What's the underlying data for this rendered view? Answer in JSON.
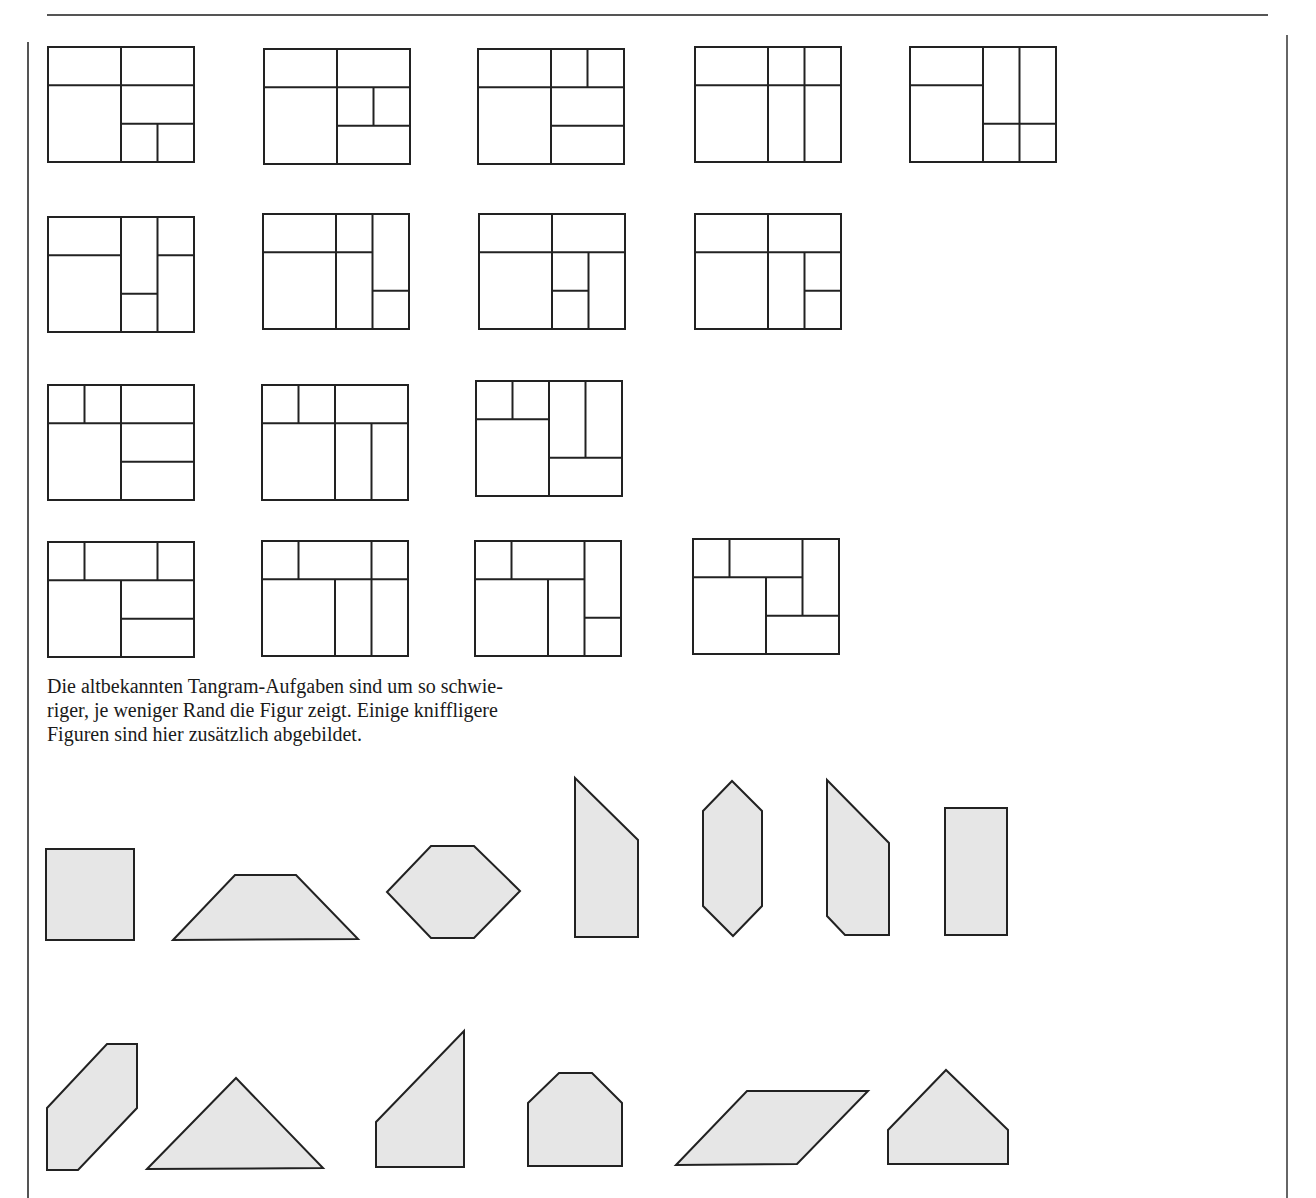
{
  "page": {
    "caption_lines": [
      "Die altbekannten Tangram-Aufgaben sind um so schwie-",
      "riger, je weniger Rand die Figur zeigt. Einige kniffligere",
      "Figuren sind hier zusätzlich abgebildet."
    ]
  },
  "colors": {
    "ink": "#222222",
    "shape_fill": "#e6e6e6",
    "rule": "#555555"
  },
  "rect_puzzles": {
    "box_width": 146,
    "box_height": 115,
    "grid": {
      "cols": 4,
      "rows": 3
    },
    "items": [
      {
        "x": 48,
        "y": 47,
        "lines": [
          [
            "h",
            1,
            0,
            4
          ],
          [
            "v",
            2,
            0,
            3
          ],
          [
            "h",
            2,
            2,
            4
          ],
          [
            "v",
            3,
            2,
            3
          ]
        ]
      },
      {
        "x": 264,
        "y": 49,
        "lines": [
          [
            "h",
            1,
            0,
            4
          ],
          [
            "v",
            2,
            0,
            3
          ],
          [
            "h",
            2,
            2,
            4
          ],
          [
            "v",
            3,
            1,
            2
          ]
        ]
      },
      {
        "x": 478,
        "y": 49,
        "lines": [
          [
            "h",
            1,
            0,
            4
          ],
          [
            "v",
            2,
            0,
            3
          ],
          [
            "v",
            3,
            0,
            1
          ],
          [
            "h",
            2,
            2,
            4
          ]
        ]
      },
      {
        "x": 695,
        "y": 47,
        "lines": [
          [
            "h",
            1,
            0,
            4
          ],
          [
            "v",
            2,
            0,
            3
          ],
          [
            "v",
            3,
            0,
            3
          ]
        ]
      },
      {
        "x": 910,
        "y": 47,
        "lines": [
          [
            "h",
            1,
            0,
            2
          ],
          [
            "v",
            2,
            0,
            3
          ],
          [
            "v",
            3,
            0,
            3
          ],
          [
            "h",
            2,
            2,
            4
          ]
        ]
      },
      {
        "x": 48,
        "y": 217,
        "lines": [
          [
            "h",
            1,
            0,
            2
          ],
          [
            "v",
            2,
            0,
            3
          ],
          [
            "v",
            3,
            0,
            3
          ],
          [
            "h",
            2,
            2,
            3
          ],
          [
            "h",
            1,
            3,
            4
          ]
        ]
      },
      {
        "x": 263,
        "y": 214,
        "lines": [
          [
            "h",
            1,
            0,
            3
          ],
          [
            "v",
            2,
            0,
            3
          ],
          [
            "v",
            3,
            0,
            3
          ],
          [
            "h",
            2,
            3,
            4
          ]
        ]
      },
      {
        "x": 479,
        "y": 214,
        "lines": [
          [
            "h",
            1,
            0,
            4
          ],
          [
            "v",
            2,
            0,
            3
          ],
          [
            "v",
            3,
            1,
            3
          ],
          [
            "h",
            2,
            2,
            3
          ]
        ]
      },
      {
        "x": 695,
        "y": 214,
        "lines": [
          [
            "h",
            1,
            0,
            4
          ],
          [
            "v",
            2,
            0,
            3
          ],
          [
            "v",
            3,
            1,
            3
          ],
          [
            "h",
            2,
            3,
            4
          ]
        ]
      },
      {
        "x": 48,
        "y": 385,
        "lines": [
          [
            "h",
            1,
            0,
            4
          ],
          [
            "v",
            1,
            0,
            1
          ],
          [
            "v",
            2,
            0,
            3
          ],
          [
            "h",
            2,
            2,
            4
          ]
        ]
      },
      {
        "x": 262,
        "y": 385,
        "lines": [
          [
            "h",
            1,
            0,
            4
          ],
          [
            "v",
            1,
            0,
            1
          ],
          [
            "v",
            2,
            0,
            3
          ],
          [
            "v",
            3,
            1,
            3
          ]
        ]
      },
      {
        "x": 476,
        "y": 381,
        "lines": [
          [
            "v",
            1,
            0,
            1
          ],
          [
            "v",
            2,
            0,
            3
          ],
          [
            "h",
            1,
            0,
            2
          ],
          [
            "v",
            3,
            0,
            2
          ],
          [
            "h",
            2,
            2,
            4
          ]
        ]
      },
      {
        "x": 48,
        "y": 542,
        "lines": [
          [
            "h",
            1,
            0,
            4
          ],
          [
            "v",
            1,
            0,
            1
          ],
          [
            "v",
            3,
            0,
            1
          ],
          [
            "v",
            2,
            1,
            3
          ],
          [
            "h",
            2,
            2,
            4
          ]
        ]
      },
      {
        "x": 262,
        "y": 541,
        "lines": [
          [
            "h",
            1,
            0,
            4
          ],
          [
            "v",
            1,
            0,
            1
          ],
          [
            "v",
            3,
            0,
            3
          ],
          [
            "v",
            2,
            1,
            3
          ]
        ]
      },
      {
        "x": 475,
        "y": 541,
        "lines": [
          [
            "h",
            1,
            0,
            3
          ],
          [
            "v",
            1,
            0,
            1
          ],
          [
            "v",
            3,
            0,
            3
          ],
          [
            "v",
            2,
            1,
            3
          ],
          [
            "h",
            2,
            3,
            4
          ]
        ]
      },
      {
        "x": 693,
        "y": 539,
        "lines": [
          [
            "h",
            1,
            0,
            3
          ],
          [
            "v",
            1,
            0,
            1
          ],
          [
            "v",
            3,
            0,
            2
          ],
          [
            "v",
            2,
            1,
            3
          ],
          [
            "h",
            2,
            2,
            4
          ]
        ]
      }
    ]
  },
  "shapes": [
    {
      "name": "square",
      "points": "46,849 134,849 134,940 46,940"
    },
    {
      "name": "trapezoid",
      "points": "173,940 235,875 296,875 358,939"
    },
    {
      "name": "hexagon",
      "points": "387,892 431,846 474,846 520,891 474,938 431,938"
    },
    {
      "name": "tall-pentagon-a",
      "points": "575,778 638,840 638,937 575,937"
    },
    {
      "name": "long-hexagon",
      "points": "703,811 732,781 762,811 762,906 733,936 703,906"
    },
    {
      "name": "tall-pentagon-b",
      "points": "827,780 889,843 889,935 845,935 827,916"
    },
    {
      "name": "rectangle",
      "points": "945,808 1007,808 1007,935 945,935"
    },
    {
      "name": "slanted-hexagon",
      "points": "47,1108 107,1044 137,1044 137,1108 78,1170 47,1170"
    },
    {
      "name": "triangle",
      "points": "147,1169 236,1078 323,1168"
    },
    {
      "name": "right-trapezoid",
      "points": "376,1122 464,1031 464,1167 376,1167"
    },
    {
      "name": "house-octagon",
      "points": "528,1103 559,1073 592,1073 622,1103 622,1166 528,1166"
    },
    {
      "name": "parallelogram",
      "points": "676,1165 747,1091 868,1091 797,1164"
    },
    {
      "name": "house-pentagon",
      "points": "888,1130 946,1070 1008,1130 1008,1164 888,1164"
    }
  ]
}
